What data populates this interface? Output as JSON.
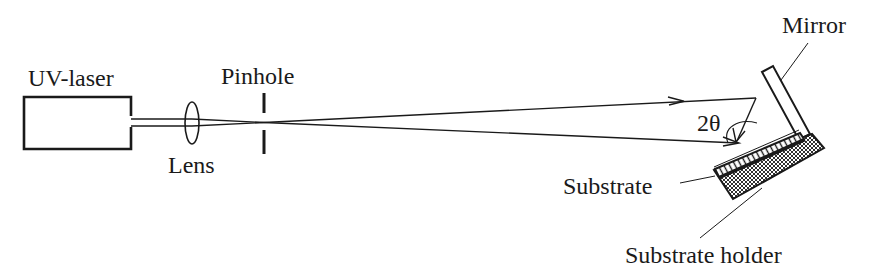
{
  "diagram": {
    "type": "optical-setup",
    "labels": {
      "laser": "UV-laser",
      "lens": "Lens",
      "pinhole": "Pinhole",
      "mirror": "Mirror",
      "angle": "2θ",
      "substrate": "Substrate",
      "holder": "Substrate holder"
    },
    "colors": {
      "ink": "#1a1a1a",
      "background": "#ffffff"
    }
  }
}
